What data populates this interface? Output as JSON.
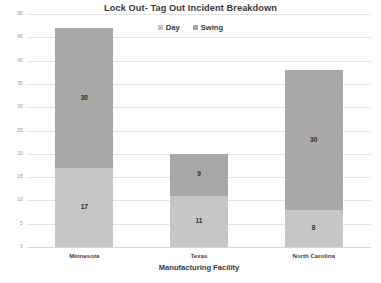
{
  "chart_data": {
    "type": "bar",
    "subtype": "stacked-column",
    "title": "Lock Out- Tag Out Incident Breakdown",
    "xlabel": "Manufacturing Facility",
    "ylabel": "",
    "categories": [
      "Minnesota",
      "Texas",
      "North Carolina"
    ],
    "series": [
      {
        "name": "Day",
        "values": [
          17,
          11,
          8
        ],
        "color": "#c6c6c6"
      },
      {
        "name": "Swing",
        "values": [
          30,
          9,
          30
        ],
        "color": "#a8a8a8"
      }
    ],
    "totals": [
      47,
      20,
      38
    ],
    "ylim": [
      0,
      50
    ],
    "yticks": [
      0,
      5,
      10,
      15,
      20,
      25,
      30,
      35,
      40,
      45,
      50
    ],
    "ytick_labels": [
      "0",
      "5",
      "10",
      "15",
      "20",
      "25",
      "30",
      "35",
      "40",
      "45",
      "50"
    ],
    "grid": true,
    "grid_color": "#e4e4e4",
    "legend_position": "top",
    "data_labels": true,
    "background": "#ffffff"
  },
  "legend": {
    "items": [
      {
        "label": "Day",
        "color": "#c6c6c6",
        "marker": "square-swatch-icon"
      },
      {
        "label": "Swing",
        "color": "#a8a8a8",
        "marker": "square-swatch-icon"
      }
    ]
  }
}
